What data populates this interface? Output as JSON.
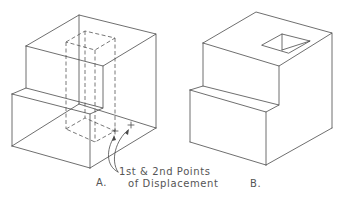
{
  "figure": {
    "view_a": {
      "label": "A.",
      "description": "Stepped block with hidden (dashed) rectangular prism showing hole location"
    },
    "view_b": {
      "label": "B.",
      "description": "Stepped block with square hole cut into top face"
    },
    "callout": {
      "line1": "1st & 2nd Points",
      "line2": "of Displacement"
    }
  },
  "colors": {
    "line": "#4a4a4a",
    "text": "#555555",
    "background": "#ffffff"
  }
}
